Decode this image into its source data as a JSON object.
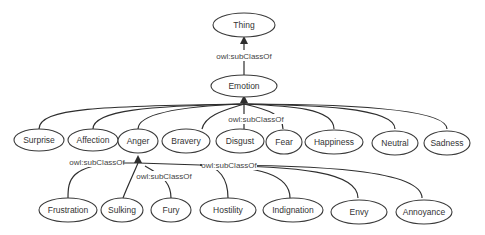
{
  "diagram": {
    "type": "ontology-class-hierarchy",
    "relation_label": "owl:subClassOf",
    "root": {
      "id": "thing",
      "label": "Thing"
    },
    "level1": {
      "id": "emotion",
      "label": "Emotion"
    },
    "emotions": [
      {
        "id": "surprise",
        "label": "Surprise"
      },
      {
        "id": "affection",
        "label": "Affection"
      },
      {
        "id": "anger",
        "label": "Anger"
      },
      {
        "id": "bravery",
        "label": "Bravery"
      },
      {
        "id": "disgust",
        "label": "Disgust"
      },
      {
        "id": "fear",
        "label": "Fear"
      },
      {
        "id": "happiness",
        "label": "Happiness"
      },
      {
        "id": "neutral",
        "label": "Neutral"
      },
      {
        "id": "sadness",
        "label": "Sadness"
      }
    ],
    "anger_subclasses": [
      {
        "id": "frustration",
        "label": "Frustration"
      },
      {
        "id": "sulking",
        "label": "Sulking"
      },
      {
        "id": "fury",
        "label": "Fury"
      },
      {
        "id": "hostility",
        "label": "Hostility"
      },
      {
        "id": "indignation",
        "label": "Indignation"
      },
      {
        "id": "envy",
        "label": "Envy"
      },
      {
        "id": "annoyance",
        "label": "Annoyance"
      }
    ],
    "edge_labels": {
      "emotion_to_thing": "owl:subClassOf",
      "emotions_to_emotion": "owl:subClassOf",
      "anger_sub_left": "owl:subClassOf",
      "anger_sub_middle": "owl:subClassOf",
      "anger_sub_right": "owl:subClassOf"
    },
    "colors": {
      "stroke": "#2e2e2e",
      "text": "#333333",
      "background": "#ffffff"
    }
  }
}
